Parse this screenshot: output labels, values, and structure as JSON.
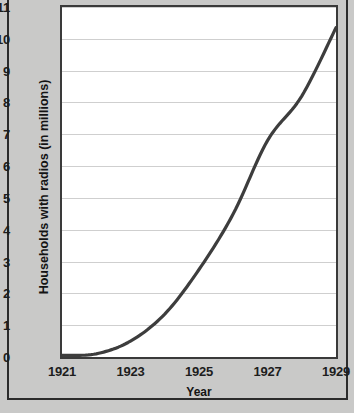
{
  "chart_data": {
    "type": "line",
    "title": "",
    "xlabel": "Year",
    "ylabel": "Households with radios (in millions)",
    "x": [
      1921,
      1922,
      1923,
      1924,
      1925,
      1926,
      1927,
      1928,
      1929
    ],
    "values": [
      0.05,
      0.1,
      0.5,
      1.35,
      2.75,
      4.5,
      6.8,
      8.2,
      10.35
    ],
    "series": [
      {
        "name": "Households with radios",
        "values": [
          0.05,
          0.1,
          0.5,
          1.35,
          2.75,
          4.5,
          6.8,
          8.2,
          10.35
        ]
      }
    ],
    "xlim": [
      1921,
      1929
    ],
    "ylim": [
      0,
      11
    ],
    "x_tick_values": [
      1921,
      1922,
      1923,
      1924,
      1925,
      1926,
      1927,
      1928,
      1929
    ],
    "x_tick_labels": [
      "1921",
      "",
      "1923",
      "",
      "1925",
      "",
      "1927",
      "",
      "1929"
    ],
    "y_tick_values": [
      0,
      1,
      2,
      3,
      4,
      5,
      6,
      7,
      8,
      9,
      10,
      11
    ],
    "y_tick_labels": [
      "0",
      "1",
      "2",
      "3",
      "4",
      "5",
      "6",
      "7",
      "8",
      "9",
      "10",
      "11"
    ],
    "grid": "horizontal",
    "legend": "none",
    "line_color": "#3d3d3d",
    "grid_color": "#cfcfcf",
    "plot_background": "#ffffff",
    "figure_background": "#c9c9c8",
    "frame_color": "#2b2b2b"
  }
}
